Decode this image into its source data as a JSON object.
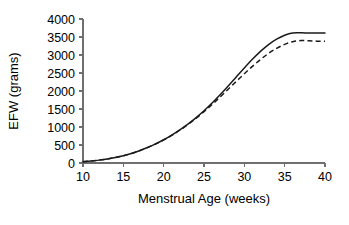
{
  "chart_data": {
    "type": "line",
    "title": "",
    "subtitle": "",
    "xlabel": "Menstrual Age (weeks)",
    "ylabel": "EFW (grams)",
    "xlim": [
      10,
      40
    ],
    "ylim": [
      0,
      4000
    ],
    "xticks": [
      10,
      15,
      20,
      25,
      30,
      35,
      40
    ],
    "yticks": [
      0,
      500,
      1000,
      1500,
      2000,
      2500,
      3000,
      3500,
      4000
    ],
    "xtick_labels": [
      "10",
      "15",
      "20",
      "25",
      "30",
      "35",
      "40"
    ],
    "ytick_labels": [
      "0",
      "500",
      "1000",
      "1500",
      "2000",
      "2500",
      "3000",
      "3500",
      "4000"
    ],
    "grid": false,
    "legend": null,
    "legend_position": "none",
    "annotations": [],
    "x": [
      10,
      11,
      12,
      13,
      14,
      15,
      16,
      17,
      18,
      19,
      20,
      21,
      22,
      23,
      24,
      25,
      26,
      27,
      28,
      29,
      30,
      31,
      32,
      33,
      34,
      35,
      36,
      37,
      38,
      39,
      40
    ],
    "series": [
      {
        "name": "solid-curve",
        "style": "solid",
        "color": "#1a1a1a",
        "values": [
          35,
          55,
          80,
          110,
          150,
          200,
          265,
          340,
          430,
          530,
          645,
          775,
          920,
          1080,
          1255,
          1450,
          1665,
          1895,
          2140,
          2390,
          2640,
          2880,
          3100,
          3290,
          3440,
          3550,
          3610,
          3615,
          3612,
          3610,
          3610
        ]
      },
      {
        "name": "dashed-curve",
        "style": "dashed",
        "color": "#1a1a1a",
        "values": [
          35,
          55,
          80,
          112,
          152,
          202,
          266,
          340,
          428,
          528,
          640,
          768,
          910,
          1068,
          1240,
          1425,
          1625,
          1835,
          2050,
          2265,
          2480,
          2685,
          2875,
          3045,
          3185,
          3295,
          3370,
          3400,
          3395,
          3385,
          3380
        ]
      }
    ]
  },
  "axes": {
    "y_title": "EFW (grams)",
    "x_title": "Menstrual Age (weeks)"
  }
}
